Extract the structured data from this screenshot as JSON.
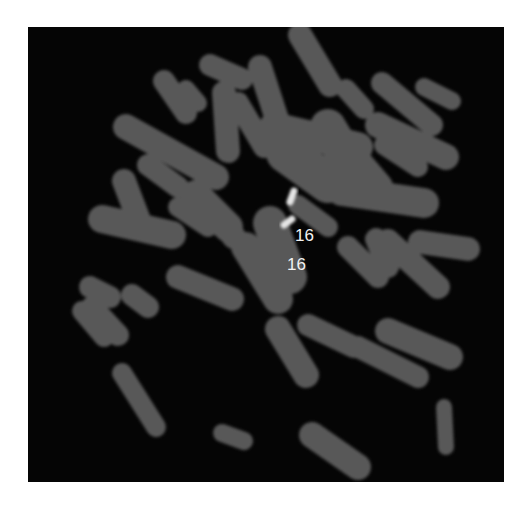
{
  "figure": {
    "type": "FISH metaphase spread (grayscale)",
    "background_color": "#050505",
    "chromosome_color": "#5a5a5a",
    "signal_color": "#e8e8e8",
    "labels": [
      {
        "id": "label-1",
        "text": "16"
      },
      {
        "id": "label-2",
        "text": "16"
      }
    ]
  }
}
